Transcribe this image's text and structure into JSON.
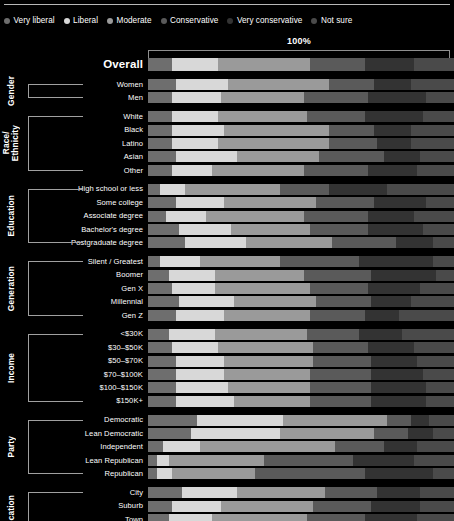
{
  "legend": {
    "items": [
      {
        "label": "Very liberal",
        "color": "#6e6e6e"
      },
      {
        "label": "Liberal",
        "color": "#d8d8d8"
      },
      {
        "label": "Moderate",
        "color": "#9a9a9a"
      },
      {
        "label": "Conservative",
        "color": "#5a5a5a"
      },
      {
        "label": "Very conservative",
        "color": "#333333"
      },
      {
        "label": "Not sure",
        "color": "#4a4a4a"
      }
    ]
  },
  "axis": {
    "max_label": "100%"
  },
  "chart_data": {
    "type": "bar",
    "title": "",
    "subtitle": "",
    "xlabel": "",
    "ylabel": "",
    "xlim": [
      0,
      100
    ],
    "grid": false,
    "legend_position": "top",
    "stacked": true,
    "normalized": true,
    "series": [
      {
        "name": "Very liberal",
        "color": "#6e6e6e"
      },
      {
        "name": "Liberal",
        "color": "#d8d8d8"
      },
      {
        "name": "Moderate",
        "color": "#9a9a9a"
      },
      {
        "name": "Conservative",
        "color": "#5a5a5a"
      },
      {
        "name": "Very conservative",
        "color": "#333333"
      },
      {
        "name": "Not sure",
        "color": "#4a4a4a"
      }
    ],
    "groups": [
      {
        "name": "",
        "rows": [
          {
            "category": "Overall",
            "values": [
              8,
              15,
              30,
              18,
              16,
              13
            ]
          }
        ]
      },
      {
        "name": "Gender",
        "rows": [
          {
            "category": "Women",
            "values": [
              9,
              17,
              33,
              15,
              12,
              14
            ]
          },
          {
            "category": "Men",
            "values": [
              8,
              16,
              27,
              21,
              19,
              9
            ]
          }
        ]
      },
      {
        "name": "Race/\nEthnicity",
        "rows": [
          {
            "category": "White",
            "values": [
              8,
              15,
              29,
              19,
              19,
              10
            ]
          },
          {
            "category": "Black",
            "values": [
              8,
              17,
              34,
              15,
              12,
              14
            ]
          },
          {
            "category": "Latino",
            "values": [
              8,
              15,
              36,
              16,
              11,
              14
            ]
          },
          {
            "category": "Asian",
            "values": [
              9,
              20,
              27,
              21,
              12,
              11
            ]
          },
          {
            "category": "Other",
            "values": [
              8,
              13,
              30,
              21,
              16,
              12
            ]
          }
        ]
      },
      {
        "name": "Education",
        "rows": [
          {
            "category": "High school or less",
            "values": [
              4,
              8,
              31,
              16,
              19,
              22
            ]
          },
          {
            "category": "Some college",
            "values": [
              9,
              16,
              30,
              19,
              17,
              9
            ]
          },
          {
            "category": "Associate degree",
            "values": [
              6,
              13,
              32,
              21,
              15,
              13
            ]
          },
          {
            "category": "Bachelor's degree",
            "values": [
              10,
              17,
              26,
              19,
              18,
              10
            ]
          },
          {
            "category": "Postgraduate degree",
            "values": [
              12,
              20,
              28,
              21,
              12,
              7
            ]
          }
        ]
      },
      {
        "name": "Generation",
        "rows": [
          {
            "category": "Silent / Greatest",
            "values": [
              4,
              13,
              26,
              26,
              24,
              7
            ]
          },
          {
            "category": "Boomer",
            "values": [
              7,
              15,
              29,
              22,
              21,
              6
            ]
          },
          {
            "category": "Gen X",
            "values": [
              8,
              14,
              31,
              19,
              17,
              11
            ]
          },
          {
            "category": "Millennial",
            "values": [
              10,
              18,
              27,
              18,
              13,
              14
            ]
          },
          {
            "category": "Gen Z",
            "values": [
              9,
              16,
              28,
              18,
              11,
              18
            ]
          }
        ]
      },
      {
        "name": "Income",
        "rows": [
          {
            "category": "<$30K",
            "values": [
              7,
              15,
              30,
              17,
              14,
              17
            ]
          },
          {
            "category": "$30–$50K",
            "values": [
              8,
              15,
              31,
              18,
              15,
              13
            ]
          },
          {
            "category": "$50–$70K",
            "values": [
              9,
              16,
              29,
              19,
              15,
              12
            ]
          },
          {
            "category": "$70–$100K",
            "values": [
              9,
              16,
              28,
              20,
              17,
              10
            ]
          },
          {
            "category": "$100–$150K",
            "values": [
              9,
              17,
              27,
              20,
              18,
              9
            ]
          },
          {
            "category": "$150K+",
            "values": [
              9,
              19,
              25,
              20,
              18,
              9
            ]
          }
        ]
      },
      {
        "name": "Party",
        "rows": [
          {
            "category": "Democratic",
            "values": [
              16,
              28,
              34,
              8,
              6,
              8
            ]
          },
          {
            "category": "Lean Democratic",
            "values": [
              14,
              29,
              31,
              11,
              8,
              7
            ]
          },
          {
            "category": "Independent",
            "values": [
              5,
              12,
              44,
              16,
              11,
              12
            ]
          },
          {
            "category": "Lean Republican",
            "values": [
              3,
              4,
              31,
              29,
              20,
              13
            ]
          },
          {
            "category": "Republican",
            "values": [
              3,
              5,
              27,
              36,
              22,
              7
            ]
          }
        ]
      },
      {
        "name": "Location",
        "rows": [
          {
            "category": "City",
            "values": [
              11,
              18,
              29,
              17,
              14,
              11
            ]
          },
          {
            "category": "Suburb",
            "values": [
              8,
              16,
              30,
              19,
              16,
              11
            ]
          },
          {
            "category": "Town",
            "values": [
              7,
              14,
              31,
              19,
              17,
              12
            ]
          },
          {
            "category": "Rural",
            "values": [
              5,
              11,
              32,
              21,
              19,
              12
            ]
          }
        ]
      }
    ]
  }
}
